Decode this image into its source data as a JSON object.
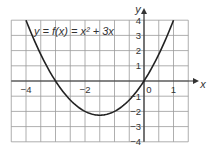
{
  "chart_data": {
    "type": "line",
    "title": "y = f(x) = x² + 3x",
    "equation": "y = f(x) = x² + 3x",
    "xlabel": "x",
    "ylabel": "y",
    "xlim": [
      -4.5,
      1.5
    ],
    "ylim": [
      -4,
      4
    ],
    "grid": true,
    "grid_step_x": 0.5,
    "grid_step_y": 1,
    "x_tick_labels": [
      "−4",
      "−2",
      "0",
      "1"
    ],
    "y_tick_labels": [
      "4",
      "3",
      "2",
      "1",
      "−1",
      "−2",
      "−3",
      "−4"
    ],
    "series": [
      {
        "name": "f(x) = x² + 3x",
        "x": [
          -4,
          -3.5,
          -3,
          -2.5,
          -2,
          -1.5,
          -1,
          -0.5,
          0,
          0.5,
          1
        ],
        "y": [
          4,
          1.75,
          0,
          -1.25,
          -2,
          -2.25,
          -2,
          -1.25,
          0,
          1.75,
          4
        ]
      }
    ],
    "vertex": [
      -1.5,
      -2.25
    ],
    "roots": [
      -3,
      0
    ]
  },
  "labels": {
    "equation": "y = f(x) = x² + 3x",
    "x_axis": "x",
    "y_axis": "y",
    "x_ticks": [
      {
        "v": -4,
        "t": "−4"
      },
      {
        "v": -2,
        "t": "−2"
      },
      {
        "v": 1,
        "t": "1"
      }
    ],
    "origin": "0",
    "y_ticks": [
      {
        "v": 4,
        "t": "4"
      },
      {
        "v": 3,
        "t": "3"
      },
      {
        "v": 2,
        "t": "2"
      },
      {
        "v": 1,
        "t": "1"
      },
      {
        "v": -1,
        "t": "−1"
      },
      {
        "v": -2,
        "t": "−2"
      },
      {
        "v": -3,
        "t": "−3"
      },
      {
        "v": -4,
        "t": "−4"
      }
    ]
  },
  "colors": {
    "grid": "#9a9a9a",
    "axis": "#333333",
    "curve": "#222222",
    "background": "#ffffff"
  }
}
